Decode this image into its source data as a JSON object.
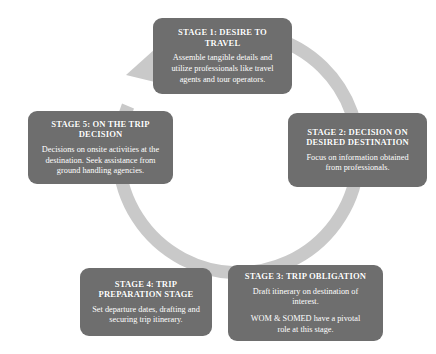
{
  "diagram": {
    "shape": "circular-arrow-cycle",
    "colors": {
      "box_fill": "#6e6e6e",
      "box_text": "#ffffff",
      "ring": "#c9c9c9",
      "background": "#ffffff"
    },
    "arrow": {
      "name": "cycle-arrow",
      "direction": "clockwise",
      "head_points_to": "STAGE 1: DESIRE TO TRAVEL"
    },
    "stages": [
      {
        "id": "stage-1",
        "title": "STAGE 1: DESIRE TO\nTRAVEL",
        "paragraphs": [
          "Assemble tangible details and\nutilize professionals like travel\nagents and tour operators."
        ]
      },
      {
        "id": "stage-2",
        "title": "STAGE 2: DECISION ON\nDESIRED DESTINATION",
        "paragraphs": [
          "Focus on information obtained\nfrom professionals."
        ]
      },
      {
        "id": "stage-3",
        "title": "STAGE 3: TRIP OBLIGATION",
        "paragraphs": [
          "Draft itinerary on destination of\ninterest.",
          "WOM & SOMED have a pivotal\nrole at this stage."
        ]
      },
      {
        "id": "stage-4",
        "title": "STAGE 4:  TRIP\nPREPARATION STAGE",
        "paragraphs": [
          "Set departure dates, drafting and\nsecuring trip itinerary."
        ]
      },
      {
        "id": "stage-5",
        "title": "STAGE 5:  ON THE TRIP\nDECISION",
        "paragraphs": [
          "Decisions on onsite activities at the\ndestination. Seek assistance from\nground handling agencies."
        ]
      }
    ]
  }
}
